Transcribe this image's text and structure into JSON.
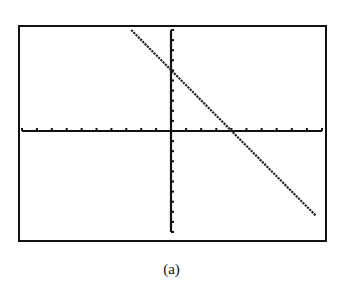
{
  "caption": "(a)",
  "colors": {
    "axis": "#111111",
    "line": "#222222",
    "frame": "#111111",
    "background": "#ffffff"
  },
  "chart_data": {
    "type": "line",
    "title": "",
    "caption": "(a)",
    "xlabel": "",
    "ylabel": "",
    "xlim": [
      -10,
      10
    ],
    "ylim": [
      -10,
      10
    ],
    "xscale": 1,
    "yscale": 1,
    "grid": false,
    "axis_ticks": true,
    "x_tick_count_each_side": 10,
    "y_tick_count_each_side": 10,
    "series": [
      {
        "name": "line",
        "equation": "y = -1.5x + 6",
        "x": [
          -2.67,
          0,
          4,
          9.6
        ],
        "y": [
          10,
          6,
          0,
          -8.4
        ]
      }
    ],
    "y_intercept": 6,
    "x_intercept": 4
  }
}
